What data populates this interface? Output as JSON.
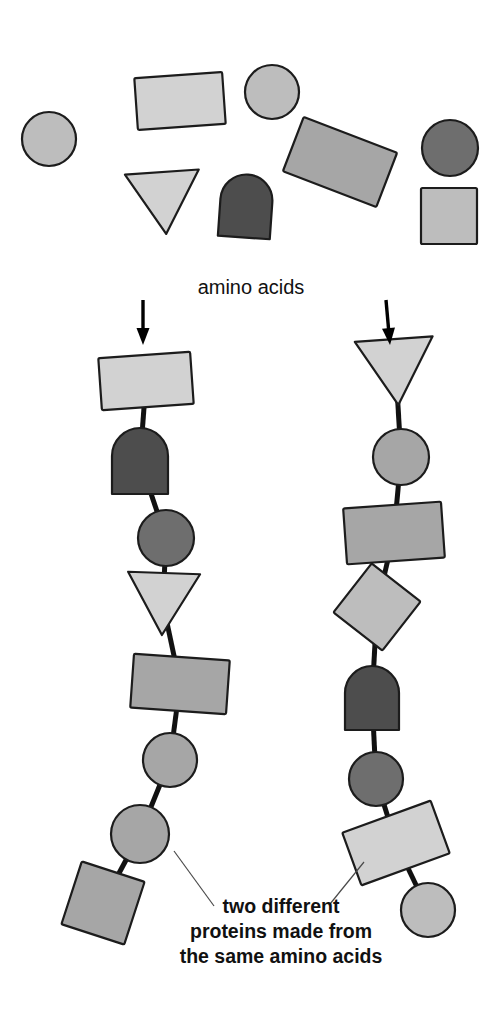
{
  "canvas": {
    "width": 502,
    "height": 1013,
    "background": "#ffffff"
  },
  "labels": {
    "amino_acids": "amino acids",
    "caption_line_1": "two different",
    "caption_line_2": "proteins made from",
    "caption_line_3": "the same amino acids"
  },
  "palette": {
    "light_gray": "#d2d2d2",
    "light_mid_gray": "#bdbdbd",
    "mid_gray": "#a6a6a6",
    "dark_gray": "#6e6e6e",
    "darkest_gray": "#4d4d4d",
    "outline": "#1c1c1c",
    "bond": "#111111",
    "leader": "#4a4a4a",
    "text": "#111111"
  },
  "free_amino_acids": [
    {
      "name": "circle-free-1",
      "type": "circle",
      "cx": 49,
      "cy": 139,
      "r": 27,
      "rotate": 0,
      "fill": "#bdbdbd"
    },
    {
      "name": "rectangle-free-1",
      "type": "rectangle",
      "cx": 180,
      "cy": 101,
      "w": 88,
      "h": 52,
      "rotate": -4,
      "fill": "#d2d2d2"
    },
    {
      "name": "circle-free-2",
      "type": "circle",
      "cx": 272,
      "cy": 92,
      "r": 27,
      "rotate": 0,
      "fill": "#bdbdbd"
    },
    {
      "name": "rectangle-free-2",
      "type": "rectangle",
      "cx": 340,
      "cy": 162,
      "w": 100,
      "h": 58,
      "rotate": 21,
      "fill": "#a6a6a6"
    },
    {
      "name": "circle-free-3",
      "type": "circle",
      "cx": 450,
      "cy": 148,
      "r": 28,
      "rotate": 0,
      "fill": "#6e6e6e"
    },
    {
      "name": "triangle-free-1",
      "type": "triangle",
      "cx": 164,
      "cy": 203,
      "w": 74,
      "h": 62,
      "rotate": -4,
      "fill": "#d2d2d2"
    },
    {
      "name": "dome-free-1",
      "type": "dome",
      "cx": 246,
      "cy": 206,
      "w": 52,
      "h": 63,
      "rotate": 4,
      "fill": "#4d4d4d"
    },
    {
      "name": "square-free-1",
      "type": "rectangle",
      "cx": 449,
      "cy": 216,
      "w": 56,
      "h": 56,
      "rotate": 0,
      "fill": "#bdbdbd"
    }
  ],
  "chains": [
    {
      "name": "protein-chain-left",
      "arrow": {
        "x1": 143,
        "y1": 300,
        "x2": 143,
        "y2": 345
      },
      "residues": [
        {
          "name": "rectangle-residue",
          "type": "rectangle",
          "cx": 146,
          "cy": 381,
          "w": 92,
          "h": 52,
          "rotate": -4,
          "fill": "#d2d2d2"
        },
        {
          "name": "dome-residue",
          "type": "dome",
          "cx": 140,
          "cy": 461,
          "w": 56,
          "h": 66,
          "rotate": 0,
          "fill": "#4d4d4d"
        },
        {
          "name": "circle-residue",
          "type": "circle",
          "cx": 166,
          "cy": 538,
          "r": 28,
          "rotate": 0,
          "fill": "#6e6e6e"
        },
        {
          "name": "triangle-residue",
          "type": "triangle",
          "cx": 163,
          "cy": 604,
          "w": 72,
          "h": 62,
          "rotate": 2,
          "fill": "#d2d2d2"
        },
        {
          "name": "rectangle-residue",
          "type": "rectangle",
          "cx": 180,
          "cy": 684,
          "w": 96,
          "h": 54,
          "rotate": 4,
          "fill": "#a6a6a6"
        },
        {
          "name": "circle-residue",
          "type": "circle",
          "cx": 170,
          "cy": 760,
          "r": 27,
          "rotate": 0,
          "fill": "#a6a6a6"
        },
        {
          "name": "circle-residue",
          "type": "circle",
          "cx": 140,
          "cy": 834,
          "r": 29,
          "rotate": 0,
          "fill": "#a6a6a6"
        },
        {
          "name": "square-residue",
          "type": "rectangle",
          "cx": 103,
          "cy": 903,
          "w": 66,
          "h": 66,
          "rotate": 18,
          "fill": "#a6a6a6"
        }
      ]
    },
    {
      "name": "protein-chain-right",
      "arrow": {
        "x1": 386,
        "y1": 300,
        "x2": 390,
        "y2": 345
      },
      "residues": [
        {
          "name": "triangle-residue",
          "type": "triangle",
          "cx": 396,
          "cy": 372,
          "w": 78,
          "h": 66,
          "rotate": -4,
          "fill": "#d2d2d2"
        },
        {
          "name": "circle-residue",
          "type": "circle",
          "cx": 401,
          "cy": 457,
          "r": 28,
          "rotate": 0,
          "fill": "#a6a6a6"
        },
        {
          "name": "rectangle-residue",
          "type": "rectangle",
          "cx": 394,
          "cy": 533,
          "w": 98,
          "h": 56,
          "rotate": -4,
          "fill": "#a6a6a6"
        },
        {
          "name": "square-residue",
          "type": "rectangle",
          "cx": 377,
          "cy": 607,
          "w": 62,
          "h": 62,
          "rotate": 38,
          "fill": "#bdbdbd"
        },
        {
          "name": "dome-residue",
          "type": "dome",
          "cx": 372,
          "cy": 698,
          "w": 54,
          "h": 64,
          "rotate": 0,
          "fill": "#4d4d4d"
        },
        {
          "name": "circle-residue",
          "type": "circle",
          "cx": 376,
          "cy": 779,
          "r": 27,
          "rotate": 0,
          "fill": "#6e6e6e"
        },
        {
          "name": "rectangle-residue",
          "type": "rectangle",
          "cx": 396,
          "cy": 843,
          "w": 94,
          "h": 56,
          "rotate": -20,
          "fill": "#d2d2d2"
        },
        {
          "name": "circle-residue",
          "type": "circle",
          "cx": 428,
          "cy": 910,
          "r": 27,
          "rotate": 0,
          "fill": "#bdbdbd"
        }
      ]
    }
  ],
  "leader_lines": [
    {
      "name": "leader-line-left",
      "x1": 174,
      "y1": 851,
      "x2": 214,
      "y2": 906
    },
    {
      "name": "leader-line-right",
      "x1": 364,
      "y1": 862,
      "x2": 330,
      "y2": 904
    }
  ],
  "label_positions": {
    "amino_acids": {
      "x": 251,
      "y": 294,
      "anchor": "middle"
    },
    "caption_1": {
      "x": 281,
      "y": 913,
      "anchor": "middle"
    },
    "caption_2": {
      "x": 281,
      "y": 938,
      "anchor": "middle"
    },
    "caption_3": {
      "x": 281,
      "y": 963,
      "anchor": "middle"
    }
  }
}
